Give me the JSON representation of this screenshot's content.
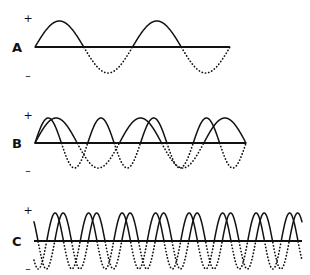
{
  "figure": {
    "background_color": "#ffffff",
    "ink_color": "#111111",
    "width": 310,
    "height": 275
  },
  "axis_marks": {
    "positive": "+",
    "negative": "–"
  },
  "rows": [
    {
      "id": "row-a",
      "label": "A",
      "label_x": 12,
      "label_y": 41,
      "plus_x": 22,
      "plus_y": 13,
      "minus_x": 22,
      "minus_y": 70,
      "baseline_y": 47,
      "baseline_x_start": 35,
      "baseline_x_end": 230,
      "wave_x_start": 35,
      "wave_x_end": 230,
      "amplitude": 26,
      "cycles": 2,
      "phase_offset": 0,
      "overlay_cycles": 0,
      "overlay_phase_offset": 0
    },
    {
      "id": "row-b",
      "label": "B",
      "label_x": 12,
      "label_y": 137,
      "plus_x": 22,
      "plus_y": 110,
      "minus_x": 22,
      "minus_y": 165,
      "baseline_y": 143,
      "baseline_x_start": 35,
      "baseline_x_end": 246,
      "wave_x_start": 35,
      "wave_x_end": 246,
      "amplitude": 25,
      "cycles": 4,
      "phase_offset": 0,
      "overlay_cycles": 2.5,
      "overlay_phase_offset": 0
    },
    {
      "id": "row-c",
      "label": "C",
      "label_x": 12,
      "label_y": 235,
      "plus_x": 22,
      "plus_y": 205,
      "minus_x": 22,
      "minus_y": 263,
      "baseline_y": 241,
      "baseline_x_start": 34,
      "baseline_x_end": 302,
      "wave_x_start": 34,
      "wave_x_end": 302,
      "amplitude": 28,
      "cycles": 8,
      "phase_offset": 0.38,
      "overlay_cycles": 8,
      "overlay_phase_offset": -0.38
    }
  ]
}
